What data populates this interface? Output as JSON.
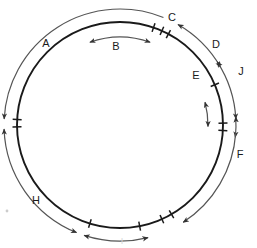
{
  "figure": {
    "type": "circular-arc-annotation-diagram",
    "stroke_color": "#1a1a1a",
    "arc_color": "#555555",
    "background": "#ffffff",
    "circle": {
      "cx": 120,
      "cy": 125,
      "r": 103
    }
  },
  "labels": {
    "A": "A",
    "B": "B",
    "C": "C",
    "D": "D",
    "E": "E",
    "F": "F",
    "H": "H",
    "J": "J",
    "I": "I"
  },
  "arcs": [
    {
      "id": "A",
      "label": "A",
      "side": "outside",
      "heads": "end",
      "from_deg": 292,
      "to_deg": 183,
      "label_x": 46,
      "label_y": 47
    },
    {
      "id": "B",
      "label": "B",
      "side": "inside",
      "heads": "both",
      "from_deg": 250,
      "to_deg": 290,
      "label_x": 116,
      "label_y": 50
    },
    {
      "id": "C",
      "label": "C",
      "side": "outside",
      "heads": "both",
      "from_deg": 300,
      "to_deg": 330,
      "label_x": 172,
      "label_y": 21
    },
    {
      "id": "D",
      "label": "D",
      "side": "outside",
      "heads": "both",
      "from_deg": 327,
      "to_deg": 357,
      "label_x": 216,
      "label_y": 48
    },
    {
      "id": "E",
      "label": "E",
      "side": "inside",
      "heads": "both",
      "from_deg": 345,
      "to_deg": 361,
      "label_x": 196,
      "label_y": 79
    },
    {
      "id": "J",
      "label": "J",
      "side": "outside",
      "heads": "both",
      "from_deg": 356,
      "to_deg": 366,
      "label_x": 241,
      "label_y": 75
    },
    {
      "id": "F",
      "label": "F",
      "side": "outside",
      "heads": "start",
      "from_deg": 57,
      "to_deg": 4,
      "label_x": 240,
      "label_y": 158
    },
    {
      "id": "H",
      "label": "H",
      "side": "outside",
      "heads": "both",
      "from_deg": 178,
      "to_deg": 112,
      "label_x": 36,
      "label_y": 204
    },
    {
      "id": "I",
      "label": "I",
      "side": "outside",
      "heads": "both",
      "from_deg": 108,
      "to_deg": 76,
      "label_x": 122,
      "label_y": 244
    }
  ],
  "ticks_deg": [
    183,
    179,
    289,
    294,
    298,
    337,
    359,
    363,
    60,
    66,
    107,
    79
  ],
  "chart_data": {
    "type": "scatter",
    "title": "",
    "categories": [
      "A",
      "B",
      "C",
      "D",
      "E",
      "F",
      "H",
      "J",
      "I"
    ],
    "values": [
      109,
      40,
      30,
      30,
      16,
      53,
      66,
      10,
      32
    ],
    "xlabel": "",
    "ylabel": "",
    "legend": []
  }
}
